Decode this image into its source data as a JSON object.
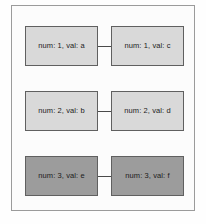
{
  "diagram": {
    "frame": {
      "border_color": "#9b9b9b",
      "background_color": "#fcfcfc"
    },
    "colors": {
      "node_light_fill": "#d9d9d9",
      "node_dark_fill": "#9c9c9c",
      "node_border": "#606060",
      "connector": "#4a4a4a",
      "text": "#1b1b1b"
    },
    "rows": [
      {
        "row_index": 1,
        "shade": "light",
        "connector": true,
        "left_node": {
          "label": "num: 1, val: a",
          "num": 1,
          "val": "a"
        },
        "right_node": {
          "label": "num: 1, val: c",
          "num": 1,
          "val": "c"
        }
      },
      {
        "row_index": 2,
        "shade": "light",
        "connector": true,
        "left_node": {
          "label": "num: 2, val: b",
          "num": 2,
          "val": "b"
        },
        "right_node": {
          "label": "num: 2, val: d",
          "num": 2,
          "val": "d"
        }
      },
      {
        "row_index": 3,
        "shade": "dark",
        "connector": true,
        "left_node": {
          "label": "num: 3, val: e",
          "num": 3,
          "val": "e"
        },
        "right_node": {
          "label": "num: 3, val: f",
          "num": 3,
          "val": "f"
        }
      }
    ]
  }
}
